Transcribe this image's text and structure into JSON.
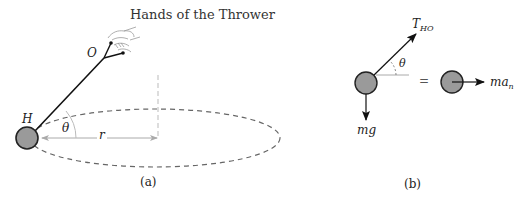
{
  "figure_a": {
    "title": "Hands of the Thrower",
    "point_O": "O",
    "point_H": "H",
    "angle": "θ",
    "radius": "r",
    "caption": "(a)"
  },
  "figure_b": {
    "tension_main": "T",
    "tension_sub": "HO",
    "angle": "θ",
    "weight": "mg",
    "equals": "=",
    "inertia_main": "ma",
    "inertia_sub": "n",
    "caption": "(b)"
  },
  "colors": {
    "bob_fill": "#9a9a9a",
    "line": "#111111",
    "dashed": "#666666",
    "guide": "#aaaaaa"
  }
}
